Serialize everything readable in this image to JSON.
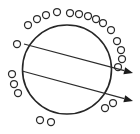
{
  "figure": {
    "background_color": "#ffffff",
    "stroke_color": "#262626",
    "particle_fill_color": "#ffffff",
    "particle_stroke_color": "#2b2b2b",
    "arrow_color": "#1c1c1c"
  },
  "chart_data": {
    "type": "scatter",
    "title": "",
    "xlabel": "",
    "ylabel": "",
    "grid": false,
    "legend": null,
    "xlim": [
      0,
      140
    ],
    "ylim": [
      0,
      134
    ],
    "main_circle": {
      "cx": 67,
      "cy": 69.5,
      "r": 44.5
    },
    "particle_radius": 3.5,
    "particle_count": 22,
    "particles": [
      {
        "cx": 28,
        "cy": 25
      },
      {
        "cx": 37,
        "cy": 19
      },
      {
        "cx": 46,
        "cy": 15
      },
      {
        "cx": 57,
        "cy": 12
      },
      {
        "cx": 70,
        "cy": 13
      },
      {
        "cx": 79,
        "cy": 14
      },
      {
        "cx": 88,
        "cy": 16
      },
      {
        "cx": 96,
        "cy": 19
      },
      {
        "cx": 103,
        "cy": 23
      },
      {
        "cx": 111,
        "cy": 30
      },
      {
        "cx": 117,
        "cy": 41
      },
      {
        "cx": 121,
        "cy": 50
      },
      {
        "cx": 122,
        "cy": 59
      },
      {
        "cx": 118,
        "cy": 67
      },
      {
        "cx": 17,
        "cy": 44
      },
      {
        "cx": 12,
        "cy": 74
      },
      {
        "cx": 14,
        "cy": 84
      },
      {
        "cx": 18,
        "cy": 93
      },
      {
        "cx": 40,
        "cy": 120
      },
      {
        "cx": 51,
        "cy": 122
      },
      {
        "cx": 105,
        "cy": 108
      },
      {
        "cx": 113,
        "cy": 103
      }
    ],
    "rays": [
      {
        "name": "upper-ray",
        "x1": 24,
        "y1": 44,
        "x2": 133,
        "y2": 73,
        "direction": "right",
        "arrowhead": true
      },
      {
        "name": "lower-ray",
        "x1": 22,
        "y1": 71,
        "x2": 133,
        "y2": 101,
        "direction": "right",
        "arrowhead": true
      }
    ]
  }
}
